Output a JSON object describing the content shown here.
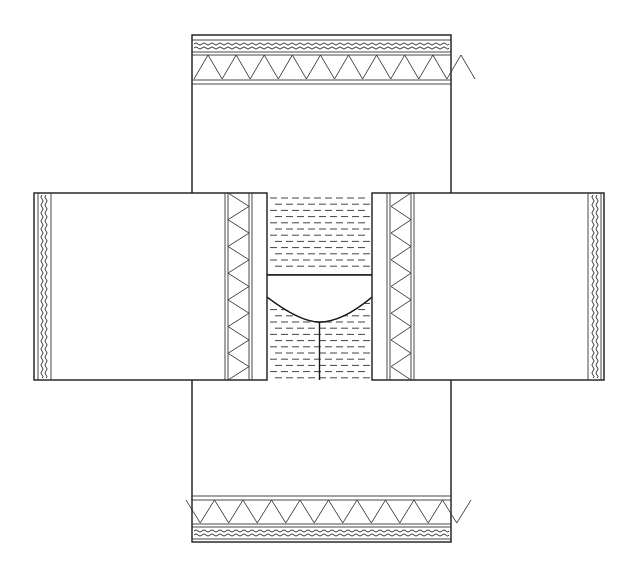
{
  "diagram": {
    "title": "Garment layout pattern",
    "colors": {
      "line": "#1a1a1a",
      "background": "#ffffff",
      "hatch": "#444444"
    },
    "panels": [
      {
        "id": "top",
        "label": "Upper vertical panel",
        "border_motifs": [
          "wavy-line",
          "zigzag"
        ]
      },
      {
        "id": "bottom",
        "label": "Lower vertical panel",
        "border_motifs": [
          "zigzag",
          "wavy-line"
        ]
      },
      {
        "id": "left",
        "label": "Left horizontal panel",
        "border_motifs": [
          "wavy-line",
          "zigzag"
        ]
      },
      {
        "id": "right",
        "label": "Right horizontal panel",
        "border_motifs": [
          "zigzag",
          "wavy-line"
        ]
      },
      {
        "id": "center",
        "label": "Central hatched section with neck opening",
        "border_motifs": [
          "dash-hatching"
        ]
      }
    ],
    "zigzag_counts": {
      "top_band_peaks": 10,
      "bottom_band_peaks": 10,
      "left_band_peaks": 7,
      "right_band_peaks": 7
    }
  }
}
